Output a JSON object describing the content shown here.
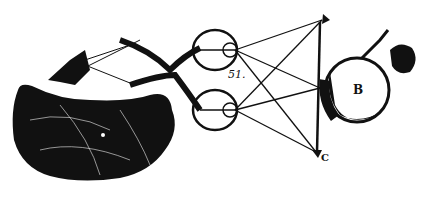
{
  "figure": {
    "labels": {
      "figure_number": "51.",
      "apple": "B",
      "arrow_bottom": "C",
      "brain_mark": "F"
    },
    "colors": {
      "ink": "#111111",
      "paper": "#ffffff"
    }
  }
}
